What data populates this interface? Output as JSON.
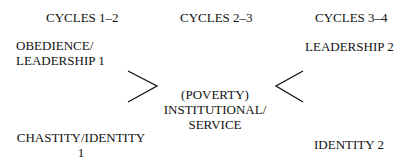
{
  "headers": {
    "col1": "CYCLES 1–2",
    "col2": "CYCLES 2–3",
    "col3": "CYCLES 3–4"
  },
  "nodes": {
    "top_left": [
      "OBEDIENCE/",
      "LEADERSHIP 1"
    ],
    "top_right": "LEADERSHIP 2",
    "center": [
      "(POVERTY)",
      "INSTITUTIONAL/",
      "SERVICE"
    ],
    "bottom_left": [
      "CHASTITY/IDENTITY",
      "1"
    ],
    "bottom_right": "IDENTITY 2"
  },
  "connectors": {
    "left": "chevron-right",
    "right": "chevron-left"
  }
}
